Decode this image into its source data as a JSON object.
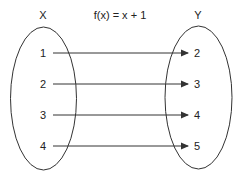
{
  "title": "f(x) = x + 1",
  "domain_set": {
    "label": "X",
    "elements": [
      "1",
      "2",
      "3",
      "4"
    ]
  },
  "codomain_set": {
    "label": "Y",
    "elements": [
      "2",
      "3",
      "4",
      "5"
    ]
  },
  "mappings": [
    {
      "from": "1",
      "to": "2"
    },
    {
      "from": "2",
      "to": "3"
    },
    {
      "from": "3",
      "to": "4"
    },
    {
      "from": "4",
      "to": "5"
    }
  ],
  "colors": {
    "stroke": "#333333",
    "text": "#222222",
    "background": "#ffffff"
  }
}
